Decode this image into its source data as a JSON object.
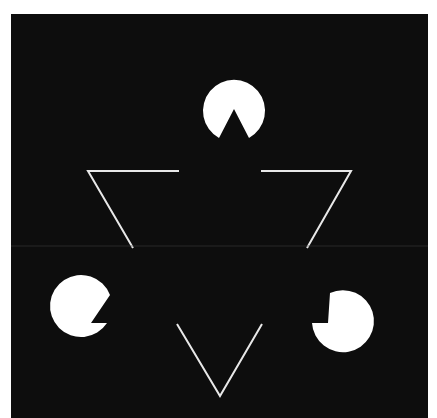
{
  "figure": {
    "background_color": "#0d0d0d",
    "shape_color": "#ffffff",
    "pacmen": [
      {
        "cx": 234,
        "cy": 100,
        "r": 31
      },
      {
        "cx": 76,
        "cy": 322,
        "r": 31
      },
      {
        "cx": 342,
        "cy": 322,
        "r": 31
      }
    ],
    "outline_segments": [
      {
        "points": "179,171 88,171 133,248"
      },
      {
        "points": "261,171 351,171 307,248"
      },
      {
        "points": "177,324 220,396 262,324"
      }
    ]
  }
}
